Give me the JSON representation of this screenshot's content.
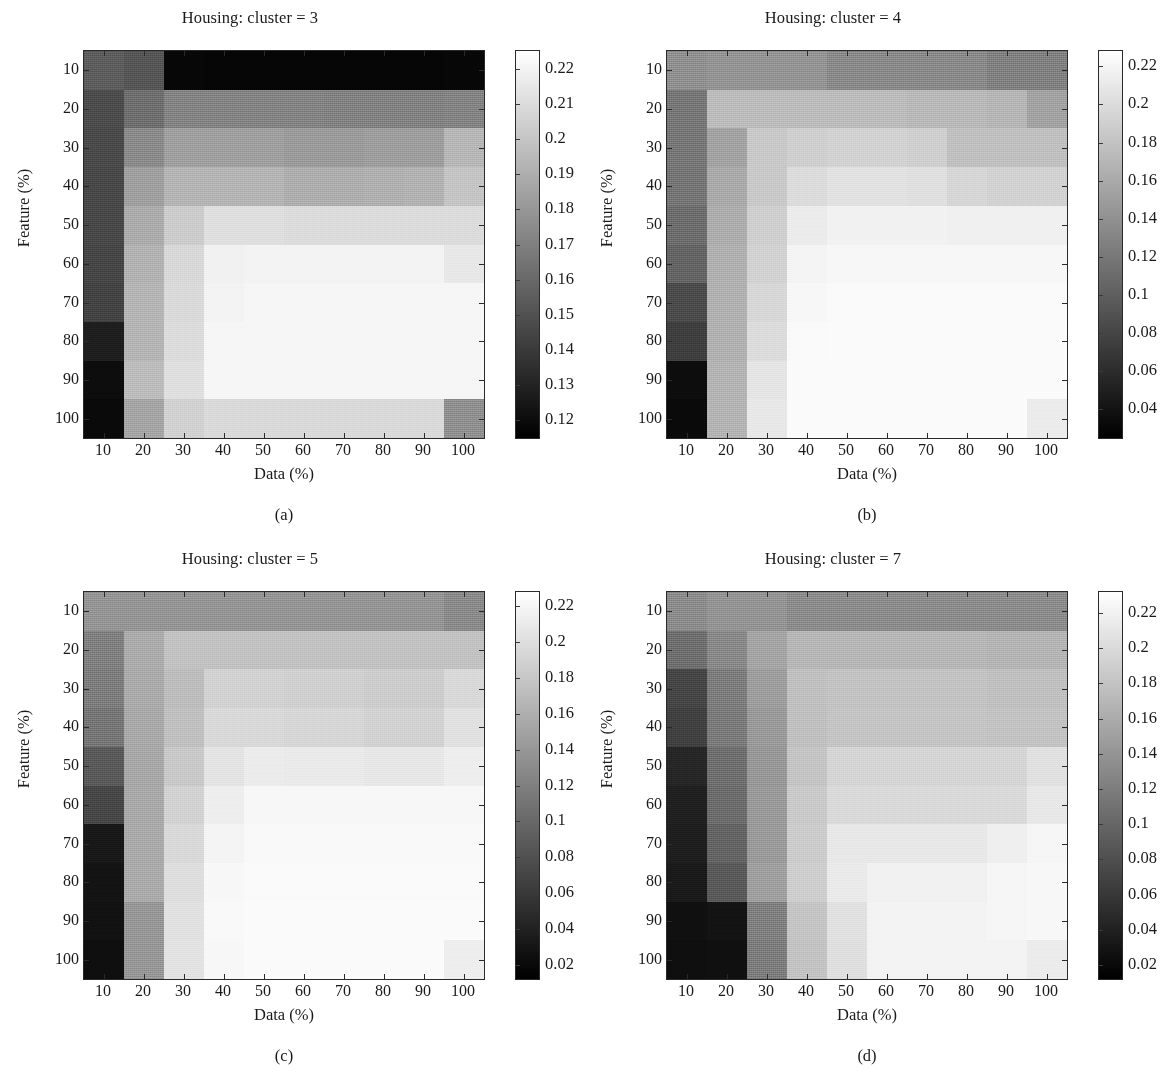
{
  "figure": {
    "panel_count": 4,
    "axis_x_title": "Data (%)",
    "axis_y_title": "Feature (%)",
    "x_ticks": [
      "10",
      "20",
      "30",
      "40",
      "50",
      "60",
      "70",
      "80",
      "90",
      "100"
    ],
    "y_ticks": [
      "10",
      "20",
      "30",
      "40",
      "50",
      "60",
      "70",
      "80",
      "90",
      "100"
    ]
  },
  "panels": [
    {
      "caption": "(a)",
      "title": "Housing: cluster = 3",
      "cbar_labels": [
        "0.22",
        "0.21",
        "0.2",
        "0.19",
        "0.18",
        "0.17",
        "0.16",
        "0.15",
        "0.14",
        "0.13",
        "0.12"
      ]
    },
    {
      "caption": "(b)",
      "title": "Housing: cluster = 4",
      "cbar_labels": [
        "0.22",
        "0.2",
        "0.18",
        "0.16",
        "0.14",
        "0.12",
        "0.1",
        "0.08",
        "0.06",
        "0.04"
      ]
    },
    {
      "caption": "(c)",
      "title": "Housing: cluster = 5",
      "cbar_labels": [
        "0.22",
        "0.2",
        "0.18",
        "0.16",
        "0.14",
        "0.12",
        "0.1",
        "0.08",
        "0.06",
        "0.04",
        "0.02"
      ]
    },
    {
      "caption": "(d)",
      "title": "Housing: cluster = 7",
      "cbar_labels": [
        "0.22",
        "0.2",
        "0.18",
        "0.16",
        "0.14",
        "0.12",
        "0.1",
        "0.08",
        "0.06",
        "0.04",
        "0.02"
      ]
    }
  ],
  "chart_data": [
    {
      "type": "heatmap",
      "title": "Housing: cluster = 3",
      "subplot": "(a)",
      "xlabel": "Data (%)",
      "ylabel": "Feature (%)",
      "x": [
        10,
        20,
        30,
        40,
        50,
        60,
        70,
        80,
        90,
        100
      ],
      "y": [
        10,
        20,
        30,
        40,
        50,
        60,
        70,
        80,
        90,
        100
      ],
      "colormap": "gray",
      "clim": [
        0.115,
        0.225
      ],
      "cbar_ticks": [
        0.12,
        0.13,
        0.14,
        0.15,
        0.16,
        0.17,
        0.18,
        0.19,
        0.2,
        0.21,
        0.22
      ],
      "values": [
        [
          0.155,
          0.152,
          0.118,
          0.117,
          0.117,
          0.117,
          0.117,
          0.117,
          0.117,
          0.118
        ],
        [
          0.148,
          0.163,
          0.172,
          0.172,
          0.172,
          0.172,
          0.171,
          0.171,
          0.171,
          0.172
        ],
        [
          0.147,
          0.175,
          0.184,
          0.184,
          0.184,
          0.182,
          0.182,
          0.183,
          0.183,
          0.194
        ],
        [
          0.146,
          0.184,
          0.193,
          0.193,
          0.193,
          0.19,
          0.19,
          0.191,
          0.192,
          0.2
        ],
        [
          0.146,
          0.189,
          0.203,
          0.211,
          0.211,
          0.21,
          0.21,
          0.21,
          0.21,
          0.21
        ],
        [
          0.145,
          0.192,
          0.208,
          0.219,
          0.22,
          0.22,
          0.22,
          0.22,
          0.22,
          0.215
        ],
        [
          0.144,
          0.193,
          0.209,
          0.22,
          0.221,
          0.221,
          0.221,
          0.221,
          0.221,
          0.221
        ],
        [
          0.128,
          0.193,
          0.21,
          0.221,
          0.221,
          0.221,
          0.221,
          0.221,
          0.221,
          0.221
        ],
        [
          0.12,
          0.196,
          0.211,
          0.221,
          0.221,
          0.221,
          0.221,
          0.221,
          0.221,
          0.221
        ],
        [
          0.119,
          0.186,
          0.205,
          0.209,
          0.209,
          0.209,
          0.209,
          0.209,
          0.209,
          0.177
        ]
      ]
    },
    {
      "type": "heatmap",
      "title": "Housing: cluster = 4",
      "subplot": "(b)",
      "xlabel": "Data (%)",
      "ylabel": "Feature (%)",
      "x": [
        10,
        20,
        30,
        40,
        50,
        60,
        70,
        80,
        90,
        100
      ],
      "y": [
        10,
        20,
        30,
        40,
        50,
        60,
        70,
        80,
        90,
        100
      ],
      "colormap": "gray",
      "clim": [
        0.025,
        0.228
      ],
      "cbar_ticks": [
        0.04,
        0.06,
        0.08,
        0.1,
        0.12,
        0.14,
        0.16,
        0.18,
        0.2,
        0.22
      ],
      "values": [
        [
          0.14,
          0.143,
          0.143,
          0.143,
          0.135,
          0.135,
          0.135,
          0.135,
          0.128,
          0.128
        ],
        [
          0.12,
          0.175,
          0.175,
          0.175,
          0.175,
          0.175,
          0.172,
          0.172,
          0.17,
          0.155
        ],
        [
          0.12,
          0.155,
          0.185,
          0.19,
          0.192,
          0.192,
          0.19,
          0.178,
          0.178,
          0.178
        ],
        [
          0.118,
          0.16,
          0.185,
          0.2,
          0.205,
          0.205,
          0.203,
          0.195,
          0.192,
          0.192
        ],
        [
          0.112,
          0.163,
          0.19,
          0.213,
          0.218,
          0.218,
          0.218,
          0.216,
          0.216,
          0.216
        ],
        [
          0.105,
          0.165,
          0.192,
          0.219,
          0.222,
          0.222,
          0.222,
          0.222,
          0.222,
          0.222
        ],
        [
          0.085,
          0.166,
          0.196,
          0.222,
          0.224,
          0.224,
          0.224,
          0.224,
          0.224,
          0.224
        ],
        [
          0.075,
          0.166,
          0.2,
          0.224,
          0.225,
          0.225,
          0.225,
          0.225,
          0.225,
          0.225
        ],
        [
          0.035,
          0.168,
          0.207,
          0.225,
          0.225,
          0.225,
          0.225,
          0.225,
          0.225,
          0.225
        ],
        [
          0.033,
          0.168,
          0.21,
          0.225,
          0.225,
          0.225,
          0.225,
          0.225,
          0.225,
          0.213
        ]
      ]
    },
    {
      "type": "heatmap",
      "title": "Housing: cluster = 5",
      "subplot": "(c)",
      "xlabel": "Data (%)",
      "ylabel": "Feature (%)",
      "x": [
        10,
        20,
        30,
        40,
        50,
        60,
        70,
        80,
        90,
        100
      ],
      "y": [
        10,
        20,
        30,
        40,
        50,
        60,
        70,
        80,
        90,
        100
      ],
      "colormap": "gray",
      "clim": [
        0.012,
        0.228
      ],
      "cbar_ticks": [
        0.02,
        0.04,
        0.06,
        0.08,
        0.1,
        0.12,
        0.14,
        0.16,
        0.18,
        0.2,
        0.22
      ],
      "values": [
        [
          0.138,
          0.138,
          0.138,
          0.138,
          0.138,
          0.138,
          0.138,
          0.138,
          0.138,
          0.13
        ],
        [
          0.12,
          0.158,
          0.176,
          0.176,
          0.176,
          0.176,
          0.176,
          0.176,
          0.176,
          0.176
        ],
        [
          0.118,
          0.157,
          0.172,
          0.19,
          0.19,
          0.188,
          0.188,
          0.186,
          0.186,
          0.196
        ],
        [
          0.112,
          0.155,
          0.175,
          0.196,
          0.196,
          0.193,
          0.193,
          0.19,
          0.19,
          0.203
        ],
        [
          0.088,
          0.154,
          0.182,
          0.205,
          0.212,
          0.21,
          0.21,
          0.208,
          0.208,
          0.214
        ],
        [
          0.072,
          0.155,
          0.19,
          0.214,
          0.221,
          0.221,
          0.221,
          0.221,
          0.221,
          0.221
        ],
        [
          0.032,
          0.156,
          0.196,
          0.219,
          0.223,
          0.223,
          0.223,
          0.223,
          0.223,
          0.223
        ],
        [
          0.028,
          0.157,
          0.2,
          0.222,
          0.224,
          0.224,
          0.224,
          0.224,
          0.224,
          0.224
        ],
        [
          0.026,
          0.14,
          0.203,
          0.223,
          0.225,
          0.225,
          0.225,
          0.225,
          0.225,
          0.225
        ],
        [
          0.024,
          0.14,
          0.204,
          0.222,
          0.225,
          0.225,
          0.225,
          0.225,
          0.225,
          0.214
        ]
      ]
    },
    {
      "type": "heatmap",
      "title": "Housing: cluster = 7",
      "subplot": "(d)",
      "xlabel": "Data (%)",
      "ylabel": "Feature (%)",
      "x": [
        10,
        20,
        30,
        40,
        50,
        60,
        70,
        80,
        90,
        100
      ],
      "y": [
        10,
        20,
        30,
        40,
        50,
        60,
        70,
        80,
        90,
        100
      ],
      "colormap": "gray",
      "clim": [
        0.012,
        0.232
      ],
      "cbar_ticks": [
        0.02,
        0.04,
        0.06,
        0.08,
        0.1,
        0.12,
        0.14,
        0.16,
        0.18,
        0.2,
        0.22
      ],
      "values": [
        [
          0.133,
          0.14,
          0.14,
          0.133,
          0.133,
          0.133,
          0.133,
          0.133,
          0.133,
          0.133
        ],
        [
          0.108,
          0.13,
          0.154,
          0.17,
          0.17,
          0.17,
          0.17,
          0.17,
          0.168,
          0.168
        ],
        [
          0.072,
          0.12,
          0.148,
          0.178,
          0.18,
          0.18,
          0.18,
          0.18,
          0.178,
          0.178
        ],
        [
          0.068,
          0.118,
          0.145,
          0.178,
          0.182,
          0.182,
          0.182,
          0.182,
          0.18,
          0.18
        ],
        [
          0.045,
          0.108,
          0.143,
          0.182,
          0.196,
          0.196,
          0.196,
          0.196,
          0.196,
          0.206
        ],
        [
          0.04,
          0.105,
          0.145,
          0.186,
          0.2,
          0.2,
          0.2,
          0.2,
          0.2,
          0.212
        ],
        [
          0.038,
          0.098,
          0.146,
          0.188,
          0.212,
          0.212,
          0.212,
          0.212,
          0.218,
          0.224
        ],
        [
          0.034,
          0.09,
          0.15,
          0.19,
          0.214,
          0.22,
          0.22,
          0.22,
          0.224,
          0.226
        ],
        [
          0.026,
          0.028,
          0.122,
          0.182,
          0.206,
          0.222,
          0.222,
          0.222,
          0.224,
          0.226
        ],
        [
          0.024,
          0.026,
          0.12,
          0.18,
          0.204,
          0.222,
          0.222,
          0.222,
          0.222,
          0.216
        ]
      ]
    }
  ]
}
